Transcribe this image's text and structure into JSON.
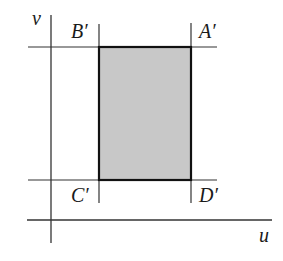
{
  "diagram": {
    "type": "coordinate-rectangle",
    "axes": {
      "horizontal_label": "u",
      "vertical_label": "v"
    },
    "region": {
      "fill_color": "#c8c8c8",
      "edge_color": "#1a1a1a",
      "vertices": [
        {
          "name": "A′",
          "position": "top-right"
        },
        {
          "name": "B′",
          "position": "top-left"
        },
        {
          "name": "C′",
          "position": "bottom-left"
        },
        {
          "name": "D′",
          "position": "bottom-right"
        }
      ]
    },
    "labels": {
      "A": "A′",
      "B": "B′",
      "C": "C′",
      "D": "D′",
      "u": "u",
      "v": "v"
    }
  }
}
